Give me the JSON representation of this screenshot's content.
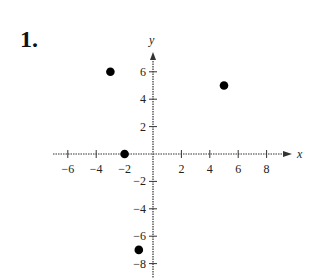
{
  "problem_number": "1.",
  "chart_data": {
    "type": "scatter",
    "title": "",
    "xlabel": "x",
    "ylabel": "y",
    "x_ticks": [
      -6,
      -4,
      -2,
      2,
      4,
      6,
      8
    ],
    "y_ticks": [
      6,
      4,
      2,
      -2,
      -4,
      -6,
      -8
    ],
    "xlim": [
      -7,
      9
    ],
    "ylim": [
      -9,
      7
    ],
    "grid": false,
    "points": [
      {
        "x": -3,
        "y": 6
      },
      {
        "x": 5,
        "y": 5
      },
      {
        "x": -2,
        "y": 0
      },
      {
        "x": -1,
        "y": -7
      }
    ]
  }
}
